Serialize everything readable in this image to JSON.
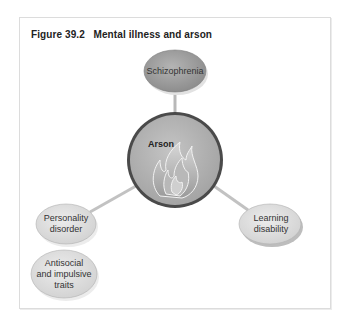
{
  "figure": {
    "title": "Figure 39.2   Mental illness and arson"
  },
  "diagram": {
    "center": {
      "label": "Arson",
      "icon": "flame-icon"
    },
    "nodes": [
      {
        "id": "schizophrenia",
        "label": "Schizophrenia"
      },
      {
        "id": "personality-disorder",
        "label_lines": [
          "Personality",
          "disorder"
        ]
      },
      {
        "id": "antisocial-traits",
        "label_lines": [
          "Antisocial",
          "and impulsive",
          "traits"
        ]
      },
      {
        "id": "learning-disability",
        "label_lines": [
          "Learning",
          "disability"
        ]
      }
    ],
    "colors": {
      "frame_border": "#dcdcdc",
      "connector": "#b8b8b8",
      "schizophrenia_fill": "#9c9c9c",
      "center_fill": "#b0b0b0",
      "center_border": "#555555",
      "light_node_fill": "#dedede"
    }
  }
}
